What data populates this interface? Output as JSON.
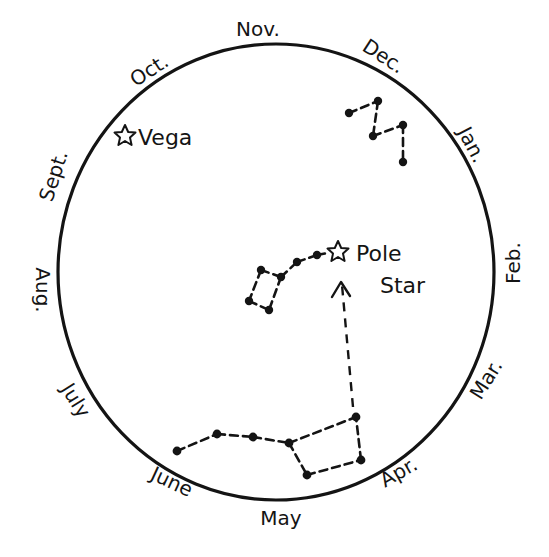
{
  "diagram": {
    "colors": {
      "ink": "#141414",
      "background": "#ffffff"
    },
    "circle": {
      "cx": 276,
      "cy": 272,
      "rx": 218,
      "ry": 228
    },
    "months": [
      {
        "label": "Nov.",
        "x": 258,
        "y": 36,
        "rotate": 0
      },
      {
        "label": "Dec.",
        "x": 380,
        "y": 60,
        "rotate": 33
      },
      {
        "label": "Jan.",
        "x": 465,
        "y": 148,
        "rotate": 62
      },
      {
        "label": "Feb.",
        "x": 518,
        "y": 265,
        "rotate": -90
      },
      {
        "label": "Mar.",
        "x": 492,
        "y": 382,
        "rotate": -58
      },
      {
        "label": "Apr.",
        "x": 400,
        "y": 475,
        "rotate": -30
      },
      {
        "label": "May",
        "x": 280,
        "y": 526,
        "rotate": 0
      },
      {
        "label": "June",
        "x": 168,
        "y": 495,
        "rotate": 25
      },
      {
        "label": "July",
        "x": 75,
        "y": 408,
        "rotate": 58
      },
      {
        "label": "Aug.",
        "x": 40,
        "y": 290,
        "rotate": 90
      },
      {
        "label": "Sept.",
        "x": 55,
        "y": 175,
        "rotate": -70
      },
      {
        "label": "Oct.",
        "x": 150,
        "y": 74,
        "rotate": -33
      }
    ],
    "labels": {
      "vega": "Vega",
      "pole_star_line1": "Pole",
      "pole_star_line2": "Star"
    },
    "constellations": [
      {
        "name": "Cassiopeia",
        "stars": [
          [
            349,
            113
          ],
          [
            378,
            101
          ],
          [
            373,
            136
          ],
          [
            403,
            125
          ],
          [
            403,
            162
          ]
        ]
      },
      {
        "name": "Little Dipper",
        "stars": [
          [
            261,
            270
          ],
          [
            281,
            277
          ],
          [
            249,
            301
          ],
          [
            269,
            310
          ],
          [
            297,
            262
          ],
          [
            317,
            255
          ]
        ]
      },
      {
        "name": "Big Dipper",
        "stars": [
          [
            177,
            451
          ],
          [
            217,
            434
          ],
          [
            253,
            437
          ],
          [
            289,
            443
          ],
          [
            307,
            475
          ],
          [
            361,
            460
          ],
          [
            356,
            417
          ]
        ]
      }
    ],
    "special_stars": {
      "vega": {
        "x": 125,
        "y": 136
      },
      "pole_star": {
        "x": 338,
        "y": 252
      }
    },
    "pointer_arrow": {
      "from": [
        352,
        410
      ],
      "to": [
        341,
        283
      ]
    }
  }
}
